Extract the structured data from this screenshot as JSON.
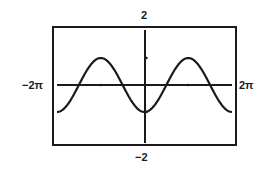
{
  "chart_data": {
    "type": "line",
    "title": "",
    "function": "y = -cos(x)",
    "xlabel": "",
    "ylabel": "",
    "xlim": [
      -6.2832,
      6.2832
    ],
    "ylim": [
      -2,
      2
    ],
    "x_tick_labels": {
      "min": "−2π",
      "max": "2π"
    },
    "y_tick_labels": {
      "max": "2",
      "min": "−2"
    },
    "x_ticks": [
      -3.1416,
      3.1416
    ],
    "y_ticks": [
      1,
      -1
    ],
    "grid": false,
    "legend": null,
    "series": [
      {
        "name": "y = -cos(x)",
        "x": [
          -6.2832,
          -4.7124,
          -3.1416,
          -1.5708,
          0,
          1.5708,
          3.1416,
          4.7124,
          6.2832
        ],
        "y": [
          -1,
          0,
          1,
          0,
          -1,
          0,
          1,
          0,
          -1
        ]
      }
    ],
    "colors": {
      "line": "#1a1a1a",
      "frame": "#1a1a1a",
      "background": "#ffffff"
    }
  }
}
